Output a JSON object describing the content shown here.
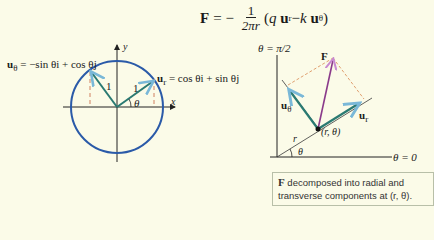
{
  "formula": {
    "lhs": "F",
    "equals": "= −",
    "numerator": "1",
    "denominator": "2πr",
    "paren_open": "(",
    "q": "q",
    "u": "u",
    "r_sub": "r",
    "minus": " − ",
    "k": "k",
    "theta_sub": "θ",
    "paren_close": ")"
  },
  "left_figure": {
    "u_theta_label": "u",
    "u_theta_sub": "θ",
    "u_theta_expr": " = −sin θi + cos θj",
    "u_r_label": "u",
    "u_r_sub": "r",
    "u_r_expr": " = cos θi + sin θj",
    "y_axis": "y",
    "x_axis": "x",
    "length_1a": "1",
    "length_1b": "1",
    "angle": "θ"
  },
  "right_figure": {
    "top_axis": "θ = π/2",
    "right_axis": "θ = 0",
    "force": "F",
    "u_theta_label": "u",
    "u_theta_sub": "θ",
    "u_r_label": "u",
    "u_r_sub": "r",
    "point": "(r, θ)",
    "radius": "r",
    "angle": "θ"
  },
  "caption": {
    "bold": "F",
    "text": " decomposed into radial and transverse components at (r, θ)."
  },
  "colors": {
    "background": "#fbfbe8",
    "circle": "#2a5aa8",
    "unit_vectors": "#2a7a72",
    "force": "#8a3a8a",
    "dashed": "#d08060",
    "arrowheads": "#7ab8d8"
  }
}
